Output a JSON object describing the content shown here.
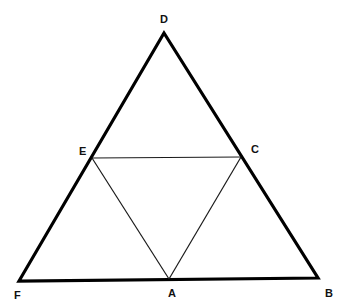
{
  "diagram": {
    "type": "geometry",
    "colors": {
      "outer_stroke": "#000000",
      "inner_stroke": "#1a1a1a",
      "label": "#111111",
      "background": "#ffffff"
    },
    "points": {
      "D": {
        "label": "D",
        "x": 164,
        "y": 33
      },
      "F": {
        "label": "F",
        "x": 19,
        "y": 281
      },
      "B": {
        "label": "B",
        "x": 318,
        "y": 278
      },
      "E": {
        "label": "E",
        "x": 92,
        "y": 158
      },
      "C": {
        "label": "C",
        "x": 241,
        "y": 157
      },
      "A": {
        "label": "A",
        "x": 169,
        "y": 279
      }
    },
    "labels": {
      "D": {
        "text": "D",
        "x": 160,
        "y": 23
      },
      "F": {
        "text": "F",
        "x": 14,
        "y": 299
      },
      "B": {
        "text": "B",
        "x": 325,
        "y": 297
      },
      "E": {
        "text": "E",
        "x": 79,
        "y": 155
      },
      "C": {
        "text": "C",
        "x": 251,
        "y": 153
      },
      "A": {
        "text": "A",
        "x": 168,
        "y": 297
      }
    },
    "outer_triangle": [
      "D",
      "F",
      "B"
    ],
    "inner_triangle": [
      "E",
      "C",
      "A"
    ]
  }
}
